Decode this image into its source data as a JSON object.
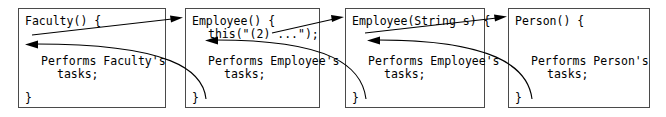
{
  "diagram": {
    "type": "call-return-sequence",
    "background_color": "#ffffff",
    "border_color": "#4a4a4a",
    "text_color": "#000000",
    "arrow_color": "#000000"
  },
  "boxes": [
    {
      "id": "faculty",
      "signature": "Faculty() {",
      "body_line_1": "Performs Faculty's",
      "body_line_2": "tasks;",
      "closing_brace": "}"
    },
    {
      "id": "employee-no-arg",
      "signature": "Employee() {",
      "this_call": "this(\"(2) ...\");",
      "body_line_1": "Performs Employee's",
      "body_line_2": "tasks;",
      "closing_brace": "}"
    },
    {
      "id": "employee-string",
      "signature": "Employee(String s) {",
      "body_line_1": "Performs Employee's",
      "body_line_2": "tasks;",
      "closing_brace": "}"
    },
    {
      "id": "person",
      "signature": "Person() {",
      "body_line_1": "Performs Person's",
      "body_line_2": "tasks;",
      "closing_brace": "}"
    }
  ],
  "arrows": {
    "call_1_label": "call-arrow-faculty-to-employee",
    "call_2_label": "call-arrow-employee-to-employee-string",
    "call_3_label": "call-arrow-employee-string-to-person",
    "return_1_label": "return-arrow-employee-to-faculty",
    "return_2_label": "return-arrow-employee-string-to-employee",
    "return_3_label": "return-arrow-person-to-employee-string"
  }
}
